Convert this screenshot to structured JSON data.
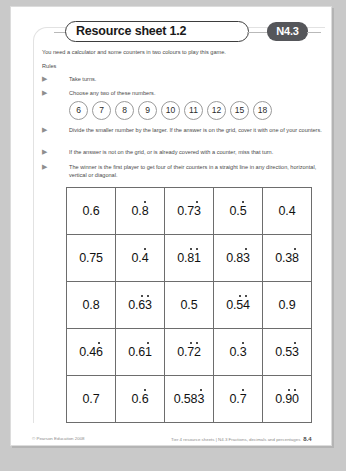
{
  "header": {
    "title": "Resource sheet 1.2",
    "code_badge": "N4.3"
  },
  "intro": "You need a calculator and some counters in two colours to play this game.",
  "rules_label": "Rules",
  "rules": [
    "Take turns.",
    "Choose any two of these numbers.",
    "Divide the smaller number by the larger. If the answer is on the grid, cover it with one of your counters.",
    "If the answer is not on the grid, or is already covered with a counter, miss that turn.",
    "The winner is the first player to get four of their counters in a straight line in any direction, horizontal, vertical or diagonal."
  ],
  "bullet_glyph": "▶",
  "numbers": [
    "6",
    "7",
    "8",
    "9",
    "10",
    "11",
    "12",
    "15",
    "18"
  ],
  "grid": {
    "rows": [
      [
        {
          "prefix": "0.6",
          "dots": ""
        },
        {
          "prefix": "0.",
          "dots": "8"
        },
        {
          "prefix": "0.7",
          "dots": "3"
        },
        {
          "prefix": "0.",
          "dots": "5"
        },
        {
          "prefix": "0.4",
          "dots": ""
        }
      ],
      [
        {
          "prefix": "0.75",
          "dots": ""
        },
        {
          "prefix": "0.",
          "dots": "4"
        },
        {
          "prefix": "0.",
          "dots": "81"
        },
        {
          "prefix": "0.8",
          "dots": "3"
        },
        {
          "prefix": "0.3",
          "dots": "8"
        }
      ],
      [
        {
          "prefix": "0.8",
          "dots": ""
        },
        {
          "prefix": "0.",
          "dots": "63"
        },
        {
          "prefix": "0.5",
          "dots": ""
        },
        {
          "prefix": "0.",
          "dots": "54"
        },
        {
          "prefix": "0.9",
          "dots": ""
        }
      ],
      [
        {
          "prefix": "0.4",
          "dots": "6"
        },
        {
          "prefix": "0.6",
          "dots": "1"
        },
        {
          "prefix": "0.",
          "dots": "72"
        },
        {
          "prefix": "0.",
          "dots": "3"
        },
        {
          "prefix": "0.5",
          "dots": "3"
        }
      ],
      [
        {
          "prefix": "0.7",
          "dots": ""
        },
        {
          "prefix": "0.",
          "dots": "6"
        },
        {
          "prefix": "0.58",
          "dots": "3"
        },
        {
          "prefix": "0.",
          "dots": "7"
        },
        {
          "prefix": "0.",
          "dots": "90"
        }
      ]
    ]
  },
  "footer": {
    "copyright": "© Pearson Education 2008",
    "source": "Tier 4 resource sheets | N4.3 Fractions, decimals and percentages",
    "page_number": "8.4"
  },
  "colors": {
    "badge_bg": "#55565a",
    "page_bg": "#ffffff",
    "outer_bg": "#c9c9c9",
    "grid_border": "#6d6d6d"
  }
}
